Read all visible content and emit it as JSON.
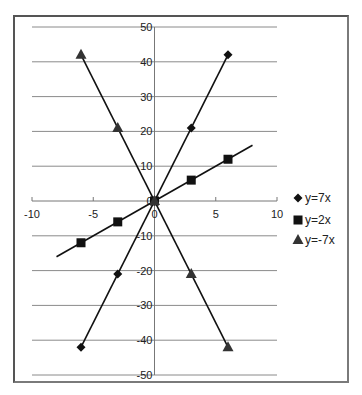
{
  "chart_data": {
    "type": "scatter",
    "title": "",
    "xlabel": "",
    "ylabel": "",
    "xlim": [
      -10,
      10
    ],
    "ylim": [
      -50,
      50
    ],
    "xticks": [
      -10,
      -5,
      0,
      5,
      10
    ],
    "yticks": [
      -50,
      -40,
      -30,
      -20,
      -10,
      0,
      10,
      20,
      30,
      40,
      50
    ],
    "xtick_labels": [
      "-10",
      "-5",
      "0",
      "5",
      "10"
    ],
    "ytick_labels": [
      "-50",
      "-40",
      "-30",
      "-20",
      "-10",
      "0",
      "10",
      "20",
      "30",
      "40",
      "50"
    ],
    "grid": "horizontal",
    "legend_position": "right",
    "series": [
      {
        "name": "y=7x",
        "marker": "diamond",
        "color": "#111111",
        "x": [
          -6,
          -3,
          0,
          3,
          6
        ],
        "y": [
          -42,
          -21,
          0,
          21,
          42
        ],
        "line_x": [
          -6,
          6
        ]
      },
      {
        "name": "y=2x",
        "marker": "square",
        "color": "#111111",
        "x": [
          -6,
          -3,
          0,
          3,
          6
        ],
        "y": [
          -12,
          -6,
          0,
          6,
          12
        ],
        "line_x": [
          -8,
          8
        ]
      },
      {
        "name": "y=-7x",
        "marker": "triangle",
        "color": "#333333",
        "x": [
          -6,
          -3,
          0,
          3,
          6
        ],
        "y": [
          42,
          21,
          0,
          -21,
          -42
        ],
        "line_x": [
          -6,
          6
        ]
      }
    ]
  }
}
